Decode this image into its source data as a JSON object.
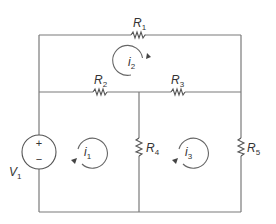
{
  "diagram": {
    "type": "circuit",
    "colors": {
      "wire": "#7a7a7a",
      "component": "#555555",
      "text": "#333333",
      "background": "#ffffff"
    },
    "source": {
      "name": "V",
      "subscript": "1",
      "plus": "+",
      "minus": "−"
    },
    "resistors": [
      {
        "name": "R",
        "subscript": "1",
        "position": "top branch"
      },
      {
        "name": "R",
        "subscript": "2",
        "position": "middle-left branch"
      },
      {
        "name": "R",
        "subscript": "3",
        "position": "middle-right branch"
      },
      {
        "name": "R",
        "subscript": "4",
        "position": "center vertical branch"
      },
      {
        "name": "R",
        "subscript": "5",
        "position": "right vertical branch"
      }
    ],
    "mesh_currents": [
      {
        "name": "i",
        "subscript": "1",
        "direction": "clockwise"
      },
      {
        "name": "i",
        "subscript": "2",
        "direction": "clockwise"
      },
      {
        "name": "i",
        "subscript": "3",
        "direction": "clockwise"
      }
    ]
  }
}
